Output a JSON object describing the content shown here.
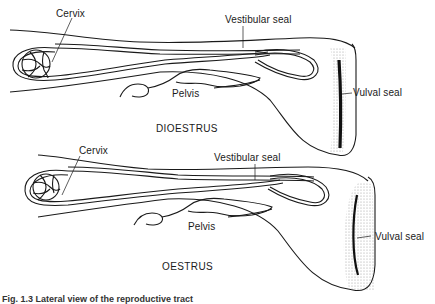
{
  "panels": [
    {
      "title": "DIOESTRUS",
      "labels": {
        "cervix": "Cervix",
        "vestibular_seal": "Vestibular seal",
        "pelvis": "Pelvis",
        "vulval_seal": "Vulval seal"
      }
    },
    {
      "title": "OESTRUS",
      "labels": {
        "cervix": "Cervix",
        "vestibular_seal": "Vestibular seal",
        "pelvis": "Pelvis",
        "vulval_seal": "Vulval seal"
      }
    }
  ],
  "caption": "Fig. 1.3 Lateral view of the reproductive tract",
  "colors": {
    "line": "#1a1a1a",
    "stipple": "#9a9a9a",
    "background": "#ffffff"
  }
}
